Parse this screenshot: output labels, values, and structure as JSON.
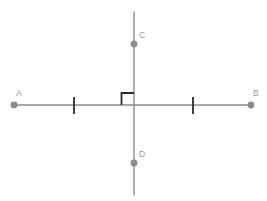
{
  "figure": {
    "kind": "geometry-diagram",
    "width": 267,
    "height": 201,
    "background_color": "#ffffff"
  },
  "colors": {
    "line": "#8c8c8c",
    "point": "#8c8c8c",
    "label": "#9a9a9a",
    "right_angle": "#2b2b2b",
    "tick": "#2b2b2b"
  },
  "lines": [
    {
      "id": "line-ab",
      "name": "horizontal-line-ab",
      "x1": 14,
      "y1": 105,
      "x2": 251,
      "y2": 105,
      "stroke_width": 1.4
    },
    {
      "id": "line-cd",
      "name": "vertical-line-cd",
      "x1": 134,
      "y1": 12,
      "x2": 134,
      "y2": 195,
      "stroke_width": 1.4
    }
  ],
  "points": [
    {
      "id": "point-a",
      "label": "A",
      "cx": 14,
      "cy": 105,
      "r": 3.4,
      "label_x": 16,
      "label_y": 96
    },
    {
      "id": "point-b",
      "label": "B",
      "cx": 251,
      "cy": 105,
      "r": 3.4,
      "label_x": 253,
      "label_y": 96
    },
    {
      "id": "point-c",
      "label": "C",
      "cx": 134,
      "cy": 44,
      "r": 3.4,
      "label_x": 139,
      "label_y": 38
    },
    {
      "id": "point-d",
      "label": "D",
      "cx": 134,
      "cy": 163,
      "r": 3.4,
      "label_x": 139,
      "label_y": 157
    }
  ],
  "tick_marks": [
    {
      "id": "tick-left",
      "name": "congruence-tick-left",
      "x": 74,
      "y1": 97,
      "y2": 114,
      "stroke_width": 1.8
    },
    {
      "id": "tick-right",
      "name": "congruence-tick-right",
      "x": 193,
      "y1": 97,
      "y2": 114,
      "stroke_width": 1.8
    }
  ],
  "right_angle_marker": {
    "id": "right-angle-marker",
    "quadrant": "upper-left",
    "path": "M 121.5 105 L 121.5 93 L 134 93",
    "stroke_width": 1.8
  }
}
